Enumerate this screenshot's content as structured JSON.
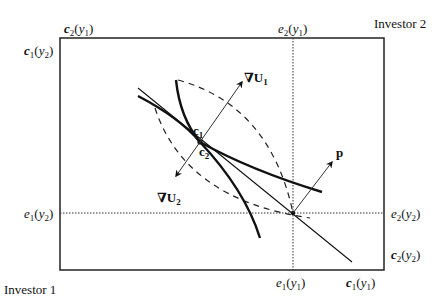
{
  "corners": {
    "top_right": "Investor 2",
    "bottom_left": "Investor 1"
  },
  "axis_labels": {
    "top_left_above": {
      "base": "c",
      "sub": "2",
      "arg": "y",
      "argsub": "1"
    },
    "top_left_side": {
      "base": "c",
      "sub": "1",
      "arg": "y",
      "argsub": "2"
    },
    "top_mid": {
      "base": "e",
      "sub": "2",
      "arg": "y",
      "argsub": "1"
    },
    "left_mid": {
      "base": "e",
      "sub": "1",
      "arg": "y",
      "argsub": "2"
    },
    "right_mid": {
      "base": "e",
      "sub": "2",
      "arg": "y",
      "argsub": "2"
    },
    "right_bottom": {
      "base": "c",
      "sub": "2",
      "arg": "y",
      "argsub": "2"
    },
    "bottom_mid": {
      "base": "e",
      "sub": "1",
      "arg": "y",
      "argsub": "1"
    },
    "bottom_right": {
      "base": "c",
      "sub": "1",
      "arg": "y",
      "argsub": "1"
    }
  },
  "points": {
    "c1": {
      "base": "c",
      "sub": "1"
    },
    "c2": {
      "base": "c",
      "sub": "2"
    }
  },
  "vectors": {
    "gradU1": {
      "nabla": "∇",
      "base": "U",
      "sub": "1"
    },
    "gradU2": {
      "nabla": "∇",
      "base": "U",
      "sub": "2"
    },
    "price": {
      "label": "p"
    }
  },
  "colors": {
    "line": "#111111",
    "background": "#ffffff"
  }
}
